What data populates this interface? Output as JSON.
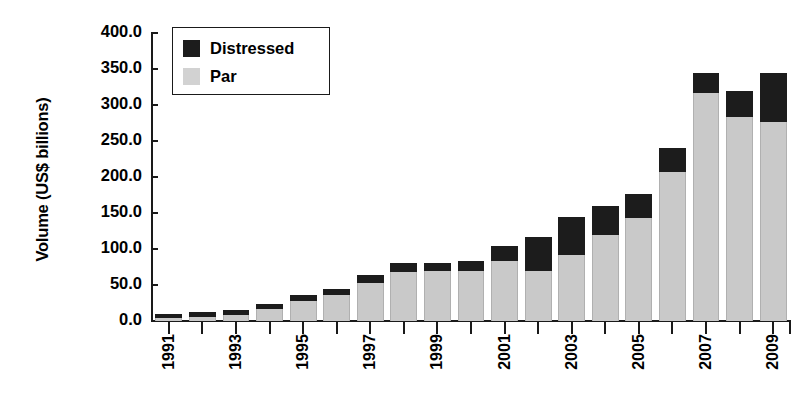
{
  "chart_data": {
    "type": "bar",
    "stacked": true,
    "title": "",
    "xlabel": "",
    "ylabel": "Volume (US$ billions)",
    "ylim": [
      0,
      400
    ],
    "ytick_step": 50,
    "ytick_labels": [
      "400.0",
      "350.0",
      "300.0",
      "250.0",
      "200.0",
      "150.0",
      "100.0",
      "50.0",
      "0.0"
    ],
    "ytick_values": [
      400,
      350,
      300,
      250,
      200,
      150,
      100,
      50,
      0
    ],
    "grid": false,
    "legend_position": "top-left",
    "categories": [
      "1991",
      "1992",
      "1993",
      "1994",
      "1995",
      "1996",
      "1997",
      "1998",
      "1999",
      "2000",
      "2001",
      "2002",
      "2003",
      "2004",
      "2005",
      "2006",
      "2007",
      "2008",
      "2009"
    ],
    "xtick_labels_shown": [
      "1991",
      "",
      "1993",
      "",
      "1995",
      "",
      "1997",
      "",
      "1999",
      "",
      "2001",
      "",
      "2003",
      "",
      "2005",
      "",
      "2007",
      "",
      "2009"
    ],
    "series": [
      {
        "name": "Par",
        "color": "#c9c9c9",
        "values": [
          4,
          6,
          9,
          16,
          28,
          36,
          53,
          68,
          70,
          70,
          83,
          70,
          92,
          120,
          143,
          207,
          316,
          283,
          277
        ]
      },
      {
        "name": "Distressed",
        "color": "#1c1c1c",
        "values": [
          6,
          7,
          7,
          7,
          8,
          8,
          11,
          12,
          11,
          13,
          21,
          47,
          53,
          40,
          33,
          33,
          28,
          37,
          68
        ]
      }
    ],
    "totals": [
      10,
      13,
      16,
      23,
      36,
      44,
      64,
      80,
      81,
      83,
      104,
      117,
      145,
      160,
      176,
      240,
      344,
      320,
      345
    ]
  },
  "legend": {
    "items": [
      {
        "label": "Distressed",
        "swatch": "black-square-icon"
      },
      {
        "label": "Par",
        "swatch": "gray-square-icon"
      }
    ]
  }
}
